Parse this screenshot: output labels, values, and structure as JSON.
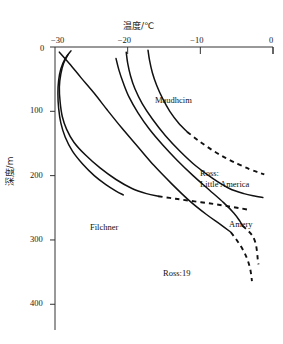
{
  "figure": {
    "background": "#ffffff",
    "line_color": "#111111",
    "axis_color": "#333333"
  },
  "axes": {
    "x_title": "温度/℃",
    "y_title": "深度/m",
    "x_ticks": [
      "-30",
      "-20",
      "-10",
      "0"
    ],
    "x_tick_labels_display": [
      "−30",
      "−20",
      "−10",
      "0"
    ],
    "y_ticks": [
      "0",
      "100",
      "200",
      "300",
      "400"
    ],
    "x_position": "top",
    "y_direction": "inverted"
  },
  "curve_labels": {
    "maudhcim": "Maudhcim",
    "ross_little_america_line1": "Ross:",
    "ross_little_america_line2": "Little America",
    "amery": "Amery",
    "filchner": "Filchner",
    "ross19": "Ross:19"
  },
  "chart_data": {
    "type": "line",
    "title": "",
    "xlabel": "温度/℃",
    "ylabel": "深度/m",
    "xlim": [
      -30,
      0
    ],
    "ylim": [
      440,
      0
    ],
    "grid": false,
    "legend": "inline-annotations",
    "x_axis_position": "top",
    "y_axis_inverted": true,
    "series": [
      {
        "name": "Maudhcim",
        "style_solid_then_dashed": true,
        "solid_points": [
          [
            -17.2,
            5
          ],
          [
            -17.0,
            20
          ],
          [
            -16.6,
            40
          ],
          [
            -16.0,
            60
          ],
          [
            -15.2,
            80
          ],
          [
            -14.2,
            100
          ],
          [
            -13.0,
            118
          ],
          [
            -11.8,
            132
          ]
        ],
        "dashed_points": [
          [
            -11.8,
            132
          ],
          [
            -10.2,
            146
          ],
          [
            -8.4,
            160
          ],
          [
            -6.6,
            172
          ],
          [
            -4.8,
            182
          ],
          [
            -3.2,
            190
          ],
          [
            -2.0,
            195
          ],
          [
            -1.2,
            198
          ]
        ]
      },
      {
        "name": "Ross: Little America",
        "style_solid_then_dashed": false,
        "solid_points": [
          [
            -20.2,
            8
          ],
          [
            -20.0,
            25
          ],
          [
            -19.6,
            45
          ],
          [
            -19.0,
            65
          ],
          [
            -18.0,
            88
          ],
          [
            -16.6,
            112
          ],
          [
            -14.8,
            138
          ],
          [
            -12.8,
            162
          ],
          [
            -10.6,
            185
          ],
          [
            -8.2,
            205
          ],
          [
            -6.0,
            220
          ],
          [
            -4.0,
            228
          ],
          [
            -2.4,
            232
          ],
          [
            -1.4,
            234
          ]
        ],
        "dashed_points": []
      },
      {
        "name": "Amery",
        "style_solid_then_dashed": true,
        "solid_points": [
          [
            -21.6,
            18
          ],
          [
            -21.2,
            36
          ],
          [
            -20.6,
            56
          ],
          [
            -19.8,
            78
          ],
          [
            -18.6,
            102
          ],
          [
            -17.0,
            128
          ],
          [
            -15.2,
            152
          ],
          [
            -13.2,
            176
          ],
          [
            -11.0,
            200
          ],
          [
            -8.8,
            222
          ],
          [
            -6.8,
            242
          ],
          [
            -5.4,
            258
          ],
          [
            -4.6,
            270
          ],
          [
            -4.2,
            278
          ]
        ],
        "dashed_points": [
          [
            -4.2,
            278
          ],
          [
            -3.4,
            286
          ],
          [
            -2.8,
            294
          ],
          [
            -2.4,
            305
          ],
          [
            -2.2,
            318
          ],
          [
            -2.1,
            330
          ],
          [
            -2.0,
            338
          ]
        ]
      },
      {
        "name": "Filchner",
        "style_solid_then_dashed": true,
        "solid_points": [
          [
            -28.2,
            12
          ],
          [
            -28.8,
            25
          ],
          [
            -29.2,
            42
          ],
          [
            -29.4,
            62
          ],
          [
            -29.3,
            85
          ],
          [
            -29.0,
            108
          ],
          [
            -28.4,
            128
          ],
          [
            -27.4,
            148
          ],
          [
            -25.8,
            168
          ],
          [
            -23.8,
            188
          ],
          [
            -21.6,
            206
          ],
          [
            -19.4,
            220
          ],
          [
            -17.4,
            228
          ],
          [
            -15.8,
            232
          ]
        ],
        "dashed_points": [
          [
            -15.8,
            232
          ],
          [
            -13.4,
            236
          ],
          [
            -10.8,
            240
          ],
          [
            -8.2,
            244
          ],
          [
            -6.0,
            248
          ],
          [
            -4.4,
            251
          ],
          [
            -3.4,
            253
          ]
        ]
      },
      {
        "name": "Ross:19",
        "style_solid_then_dashed": true,
        "solid_points": [
          [
            -29.4,
            8
          ],
          [
            -28.0,
            26
          ],
          [
            -26.4,
            48
          ],
          [
            -24.6,
            72
          ],
          [
            -22.8,
            98
          ],
          [
            -20.8,
            126
          ],
          [
            -18.6,
            155
          ],
          [
            -16.4,
            184
          ],
          [
            -14.0,
            212
          ],
          [
            -11.6,
            238
          ],
          [
            -9.2,
            260
          ],
          [
            -7.2,
            276
          ],
          [
            -5.8,
            288
          ]
        ],
        "dashed_points": [
          [
            -5.8,
            288
          ],
          [
            -5.0,
            300
          ],
          [
            -4.2,
            314
          ],
          [
            -3.6,
            328
          ],
          [
            -3.2,
            342
          ],
          [
            -3.0,
            354
          ],
          [
            -2.9,
            364
          ]
        ]
      },
      {
        "name": "unlabeled-crossing-curve",
        "style_solid_then_dashed": false,
        "solid_points": [
          [
            -27.8,
            6
          ],
          [
            -28.6,
            18
          ],
          [
            -29.2,
            34
          ],
          [
            -29.5,
            52
          ],
          [
            -29.6,
            72
          ],
          [
            -29.5,
            95
          ],
          [
            -29.2,
            118
          ],
          [
            -28.6,
            140
          ],
          [
            -27.6,
            162
          ],
          [
            -26.2,
            182
          ],
          [
            -24.6,
            200
          ],
          [
            -23.0,
            214
          ],
          [
            -21.6,
            224
          ],
          [
            -20.6,
            230
          ]
        ],
        "dashed_points": []
      }
    ]
  }
}
